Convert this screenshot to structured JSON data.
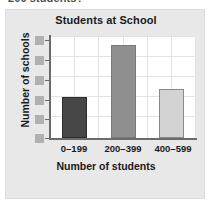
{
  "question_fragment": "200 students?",
  "panel": {
    "background_color": "#e8e8e8",
    "border_color": "#dcdcdc"
  },
  "chart_data": {
    "type": "bar",
    "title": "Students at School",
    "xlabel": "Number of students",
    "ylabel": "Number of schools",
    "categories": [
      "0–199",
      "200–399",
      "400–599"
    ],
    "values": [
      2.0,
      4.55,
      2.4
    ],
    "ylim": [
      0,
      5
    ],
    "yticks": [
      0,
      1,
      2,
      3,
      4,
      5
    ],
    "ytick_labels_hidden": true,
    "ytick_label_placeholder_count": 6,
    "grid": true,
    "legend": "none",
    "bar_colors": [
      "#474747",
      "#8f8f8f",
      "#d3d3d3"
    ],
    "bar_edge_colors": [
      "#2e2e2e",
      "#7a7a7a",
      "#8a8a8a"
    ],
    "plot_background": "#ffffff",
    "gridline_color": "#e3e3e3",
    "axis_color": "#6b6b6b",
    "text_color": "#1a1a1a",
    "redaction_color": "#b0b0b0"
  }
}
